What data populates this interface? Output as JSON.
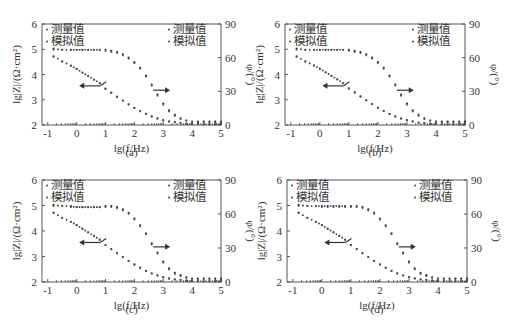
{
  "chart_data": [
    {
      "id": "a",
      "type": "scatter",
      "caption": "(a)",
      "xlabel": "lg(f/Hz)",
      "ylabel_left": "lg|Z|/(Ω·cm²)",
      "ylabel_right": "φ/(°)",
      "xlim": [
        -1.2,
        5
      ],
      "ylim_left": [
        2,
        6
      ],
      "ylim_right": [
        0,
        90
      ],
      "xticks": [
        -1,
        0,
        1,
        2,
        3,
        4,
        5
      ],
      "yticks_left": [
        2,
        3,
        4,
        5,
        6
      ],
      "yticks_right": [
        0,
        30,
        60,
        90
      ],
      "legend_left": [
        "测量值",
        "模拟值"
      ],
      "legend_right": [
        "测量值",
        "模拟值"
      ],
      "x": [
        -0.8,
        -0.5,
        -0.2,
        0,
        0.2,
        0.4,
        0.6,
        0.8,
        1.0,
        1.2,
        1.4,
        1.6,
        1.8,
        2.0,
        2.2,
        2.4,
        2.6,
        2.8,
        3.0,
        3.2,
        3.4,
        3.6,
        3.8,
        4.0,
        4.2,
        4.4,
        4.6,
        4.8,
        5.0
      ],
      "series": [
        {
          "name": "lg|Z| 测量值",
          "axis": "left",
          "values": [
            4.72,
            4.52,
            4.35,
            4.22,
            4.08,
            3.94,
            3.8,
            3.66,
            3.44,
            3.28,
            3.12,
            2.97,
            2.82,
            2.68,
            2.55,
            2.44,
            2.34,
            2.26,
            2.19,
            2.14,
            2.11,
            2.08,
            2.06,
            2.05,
            2.04,
            2.03,
            2.03,
            2.03,
            2.03
          ]
        },
        {
          "name": "lg|Z| 模拟值",
          "axis": "left",
          "values": [
            4.7,
            4.5,
            4.34,
            4.21,
            4.07,
            3.93,
            3.79,
            3.65,
            3.43,
            3.27,
            3.11,
            2.96,
            2.81,
            2.67,
            2.54,
            2.43,
            2.33,
            2.25,
            2.18,
            2.13,
            2.1,
            2.07,
            2.05,
            2.04,
            2.03,
            2.02,
            2.02,
            2.02,
            2.02
          ]
        },
        {
          "name": "φ 测量值",
          "axis": "right",
          "values": [
            68,
            67,
            67,
            67,
            67,
            67,
            67,
            67,
            67,
            66,
            65,
            63,
            60,
            56,
            51,
            44,
            36,
            27,
            19,
            13,
            9,
            6,
            4,
            3,
            3,
            3,
            3,
            3,
            3
          ]
        },
        {
          "name": "φ 模拟值",
          "axis": "right",
          "values": [
            67,
            67,
            67,
            67,
            67,
            67,
            67,
            67,
            66,
            65,
            64,
            62,
            59,
            55,
            50,
            43,
            35,
            26,
            18,
            12,
            8,
            5,
            4,
            3,
            2,
            2,
            2,
            2,
            2
          ]
        }
      ],
      "annotations": [
        "arrow-left (lg|Z| axis)",
        "arrow-right (φ axis)"
      ]
    },
    {
      "id": "b",
      "type": "scatter",
      "caption": "(b)",
      "xlabel": "lg(f/Hz)",
      "ylabel_left": "lg|Z|/(Ω·cm²)",
      "ylabel_right": "φ/(°)",
      "xlim": [
        -1.2,
        5
      ],
      "ylim_left": [
        2,
        6
      ],
      "ylim_right": [
        0,
        90
      ],
      "xticks": [
        -1,
        0,
        1,
        2,
        3,
        4,
        5
      ],
      "yticks_left": [
        2,
        3,
        4,
        5,
        6
      ],
      "yticks_right": [
        0,
        30,
        60,
        90
      ],
      "legend_left": [
        "测量值",
        "模拟值"
      ],
      "legend_right": [
        "测量值",
        "模拟值"
      ],
      "x": [
        -0.8,
        -0.5,
        -0.2,
        0,
        0.2,
        0.4,
        0.6,
        0.8,
        1.0,
        1.2,
        1.4,
        1.6,
        1.8,
        2.0,
        2.2,
        2.4,
        2.6,
        2.8,
        3.0,
        3.2,
        3.4,
        3.6,
        3.8,
        4.0,
        4.2,
        4.4,
        4.6,
        4.8,
        5.0
      ],
      "series": [
        {
          "name": "lg|Z| 测量值",
          "axis": "left",
          "values": [
            4.72,
            4.52,
            4.36,
            4.23,
            4.09,
            3.95,
            3.81,
            3.66,
            3.45,
            3.29,
            3.13,
            2.98,
            2.83,
            2.69,
            2.56,
            2.44,
            2.34,
            2.26,
            2.19,
            2.14,
            2.1,
            2.08,
            2.06,
            2.05,
            2.04,
            2.03,
            2.03,
            2.03,
            2.03
          ]
        },
        {
          "name": "lg|Z| 模拟值",
          "axis": "left",
          "values": [
            4.7,
            4.51,
            4.35,
            4.22,
            4.08,
            3.94,
            3.8,
            3.65,
            3.44,
            3.28,
            3.12,
            2.97,
            2.82,
            2.68,
            2.55,
            2.43,
            2.33,
            2.25,
            2.18,
            2.13,
            2.09,
            2.07,
            2.05,
            2.04,
            2.03,
            2.02,
            2.02,
            2.02,
            2.02
          ]
        },
        {
          "name": "φ 测量值",
          "axis": "right",
          "values": [
            68,
            67,
            67,
            67,
            67,
            67,
            67,
            67,
            67,
            66,
            65,
            63,
            60,
            56,
            51,
            44,
            36,
            27,
            19,
            13,
            9,
            6,
            4,
            3,
            3,
            3,
            3,
            3,
            3
          ]
        },
        {
          "name": "φ 模拟值",
          "axis": "right",
          "values": [
            67,
            67,
            67,
            67,
            67,
            67,
            67,
            67,
            66,
            65,
            64,
            62,
            59,
            55,
            50,
            43,
            35,
            26,
            18,
            12,
            8,
            5,
            4,
            3,
            2,
            2,
            2,
            2,
            2
          ]
        }
      ],
      "annotations": [
        "arrow-left (lg|Z| axis)",
        "arrow-right (φ axis)"
      ]
    },
    {
      "id": "c",
      "type": "scatter",
      "caption": "(c)",
      "xlabel": "lg(f/Hz)",
      "ylabel_left": "lg|Z|/(Ω·cm²)",
      "ylabel_right": "φ/(°)",
      "xlim": [
        -1.2,
        5
      ],
      "ylim_left": [
        2,
        6
      ],
      "ylim_right": [
        0,
        90
      ],
      "xticks": [
        -1,
        0,
        1,
        2,
        3,
        4,
        5
      ],
      "yticks_left": [
        2,
        3,
        4,
        5,
        6
      ],
      "yticks_right": [
        0,
        30,
        60,
        90
      ],
      "legend_left": [
        "测量值",
        "模拟值"
      ],
      "legend_right": [
        "测量值",
        "模拟值"
      ],
      "x": [
        -0.8,
        -0.5,
        -0.2,
        0,
        0.2,
        0.4,
        0.6,
        0.8,
        1.0,
        1.2,
        1.4,
        1.6,
        1.8,
        2.0,
        2.2,
        2.4,
        2.6,
        2.8,
        3.0,
        3.2,
        3.4,
        3.6,
        3.8,
        4.0,
        4.2,
        4.4,
        4.6,
        4.8,
        5.0
      ],
      "series": [
        {
          "name": "lg|Z| 测量值",
          "axis": "left",
          "values": [
            4.72,
            4.52,
            4.36,
            4.23,
            4.09,
            3.95,
            3.81,
            3.66,
            3.45,
            3.29,
            3.13,
            2.98,
            2.83,
            2.69,
            2.56,
            2.44,
            2.34,
            2.26,
            2.19,
            2.14,
            2.1,
            2.08,
            2.06,
            2.05,
            2.04,
            2.03,
            2.03,
            2.03,
            2.03
          ]
        },
        {
          "name": "lg|Z| 模拟值",
          "axis": "left",
          "values": [
            4.7,
            4.51,
            4.35,
            4.22,
            4.08,
            3.94,
            3.8,
            3.65,
            3.44,
            3.28,
            3.12,
            2.97,
            2.82,
            2.68,
            2.55,
            2.43,
            2.33,
            2.25,
            2.18,
            2.13,
            2.09,
            2.07,
            2.05,
            2.04,
            2.03,
            2.02,
            2.02,
            2.02,
            2.02
          ]
        },
        {
          "name": "φ 测量值",
          "axis": "right",
          "values": [
            68,
            67,
            67,
            66,
            66,
            66,
            66,
            66,
            67,
            67,
            66,
            64,
            61,
            56,
            50,
            43,
            34,
            26,
            18,
            12,
            8,
            6,
            4,
            3,
            3,
            3,
            3,
            3,
            3
          ]
        },
        {
          "name": "φ 模拟值",
          "axis": "right",
          "values": [
            67,
            67,
            66,
            66,
            66,
            66,
            66,
            66,
            66,
            66,
            65,
            63,
            60,
            55,
            49,
            42,
            33,
            25,
            17,
            11,
            7,
            5,
            4,
            3,
            2,
            2,
            2,
            2,
            2
          ]
        }
      ],
      "annotations": [
        "arrow-left (lg|Z| axis)",
        "arrow-right (φ axis)"
      ]
    },
    {
      "id": "d",
      "type": "scatter",
      "caption": "(d)",
      "xlabel": "lg(f/Hz)",
      "ylabel_left": "lg|Z|/(Ω·cm²)",
      "ylabel_right": "φ/(°)",
      "xlim": [
        -1.2,
        5
      ],
      "ylim_left": [
        2,
        6
      ],
      "ylim_right": [
        0,
        90
      ],
      "xticks": [
        -1,
        0,
        1,
        2,
        3,
        4,
        5
      ],
      "yticks_left": [
        2,
        3,
        4,
        5,
        6
      ],
      "yticks_right": [
        0,
        30,
        60,
        90
      ],
      "legend_left": [
        "测量值",
        "模拟值"
      ],
      "legend_right": [
        "测量值",
        "模拟值"
      ],
      "x": [
        -0.8,
        -0.5,
        -0.2,
        0,
        0.2,
        0.4,
        0.6,
        0.8,
        1.0,
        1.2,
        1.4,
        1.6,
        1.8,
        2.0,
        2.2,
        2.4,
        2.6,
        2.8,
        3.0,
        3.2,
        3.4,
        3.6,
        3.8,
        4.0,
        4.2,
        4.4,
        4.6,
        4.8,
        5.0
      ],
      "series": [
        {
          "name": "lg|Z| 测量值",
          "axis": "left",
          "values": [
            4.72,
            4.52,
            4.36,
            4.23,
            4.09,
            3.95,
            3.81,
            3.66,
            3.45,
            3.29,
            3.13,
            2.98,
            2.83,
            2.69,
            2.56,
            2.44,
            2.34,
            2.26,
            2.19,
            2.14,
            2.1,
            2.08,
            2.06,
            2.05,
            2.04,
            2.03,
            2.03,
            2.03,
            2.03
          ]
        },
        {
          "name": "lg|Z| 模拟值",
          "axis": "left",
          "values": [
            4.7,
            4.51,
            4.35,
            4.22,
            4.08,
            3.94,
            3.8,
            3.65,
            3.44,
            3.28,
            3.12,
            2.97,
            2.82,
            2.68,
            2.55,
            2.43,
            2.33,
            2.25,
            2.18,
            2.13,
            2.09,
            2.07,
            2.05,
            2.04,
            2.03,
            2.02,
            2.02,
            2.02,
            2.02
          ]
        },
        {
          "name": "φ 测量值",
          "axis": "right",
          "values": [
            68,
            67,
            67,
            67,
            67,
            67,
            67,
            67,
            67,
            67,
            66,
            64,
            61,
            56,
            50,
            43,
            34,
            26,
            18,
            12,
            8,
            6,
            4,
            3,
            3,
            3,
            3,
            3,
            3
          ]
        },
        {
          "name": "φ 模拟值",
          "axis": "right",
          "values": [
            67,
            67,
            67,
            66,
            66,
            66,
            66,
            66,
            66,
            66,
            65,
            63,
            60,
            55,
            49,
            42,
            33,
            25,
            17,
            11,
            7,
            5,
            4,
            3,
            2,
            2,
            2,
            2,
            2
          ]
        }
      ],
      "annotations": [
        "arrow-left (lg|Z| axis)",
        "arrow-right (φ axis)"
      ]
    }
  ]
}
